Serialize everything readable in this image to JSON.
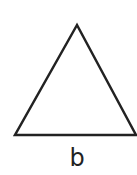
{
  "diagram": {
    "shape": "triangle",
    "vertices": [
      [
        77,
        25
      ],
      [
        15,
        135
      ],
      [
        136,
        135
      ]
    ],
    "stroke_color": "#222222",
    "fill_color": "#ffffff",
    "base_label": "b"
  }
}
